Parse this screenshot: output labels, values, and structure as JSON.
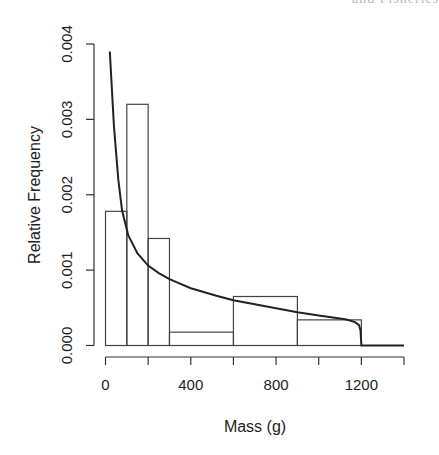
{
  "header_fragment": "and Fisheries",
  "chart_data": {
    "type": "bar",
    "subtype": "histogram_with_density_curve",
    "title": "",
    "xlabel": "Mass (g)",
    "ylabel": "Relative Frequency",
    "xlim": [
      0,
      1400
    ],
    "ylim": [
      0,
      0.004
    ],
    "xticks": [
      0,
      200,
      400,
      600,
      800,
      1000,
      1200,
      1400
    ],
    "xtick_labels": [
      "0",
      "",
      "400",
      "",
      "800",
      "",
      "1200",
      ""
    ],
    "yticks": [
      0,
      0.001,
      0.002,
      0.003,
      0.004
    ],
    "ytick_labels": [
      "0.000",
      "0.001",
      "0.002",
      "0.003",
      "0.004"
    ],
    "grid": false,
    "legend": null,
    "bins": [
      {
        "from": 0,
        "to": 100,
        "value": 0.00178
      },
      {
        "from": 100,
        "to": 200,
        "value": 0.0032
      },
      {
        "from": 200,
        "to": 300,
        "value": 0.00142
      },
      {
        "from": 300,
        "to": 600,
        "value": 0.000177
      },
      {
        "from": 600,
        "to": 900,
        "value": 0.00065
      },
      {
        "from": 900,
        "to": 1200,
        "value": 0.00034
      }
    ],
    "categories": [
      "0-100",
      "100-200",
      "200-300",
      "300-600",
      "600-900",
      "900-1200"
    ],
    "values": [
      0.00178,
      0.0032,
      0.00142,
      0.000177,
      0.00065,
      0.00034
    ],
    "curve": {
      "name": "fitted density",
      "x": [
        20,
        40,
        60,
        78,
        107,
        150,
        200,
        250,
        300,
        400,
        520,
        600,
        750,
        900,
        1000,
        1100,
        1131,
        1170,
        1189,
        1196,
        1200,
        1300,
        1400
      ],
      "y": [
        0.0039,
        0.0029,
        0.0022,
        0.00179,
        0.00146,
        0.00122,
        0.00106,
        0.00096,
        0.00088,
        0.00076,
        0.00066,
        0.0006,
        0.00052,
        0.00044,
        0.0004,
        0.00036,
        0.000345,
        0.00031,
        0.00027,
        0.0002,
        0.0,
        0.0,
        0.0
      ]
    }
  }
}
